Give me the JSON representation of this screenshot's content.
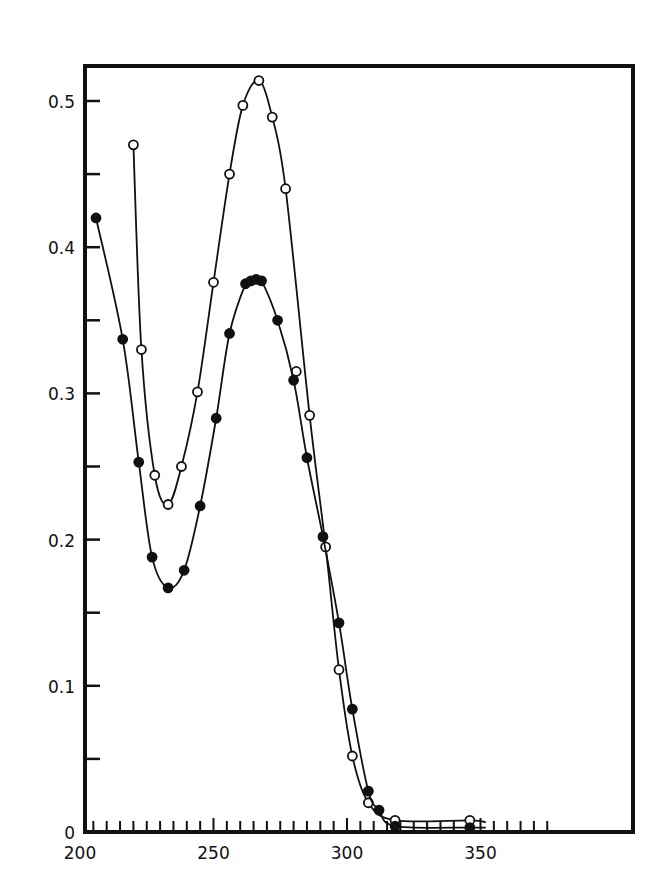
{
  "chart_data": {
    "type": "line",
    "title": "",
    "xlabel": "",
    "ylabel": "",
    "xlim": [
      200,
      378
    ],
    "ylim": [
      0,
      0.525
    ],
    "grid": false,
    "legend": null,
    "x_ticks": [
      "200",
      "250",
      "300",
      "350"
    ],
    "y_ticks": [
      "0",
      "0.1",
      "0.2",
      "0.3",
      "0.4",
      "0.5"
    ],
    "series": [
      {
        "name": "open circles",
        "marker": "open-circle",
        "x": [
          220,
          223,
          228,
          233,
          238,
          244,
          250,
          256,
          261,
          267,
          272,
          277,
          281,
          286,
          292,
          297,
          302,
          308,
          318,
          346
        ],
        "y": [
          0.47,
          0.33,
          0.244,
          0.224,
          0.25,
          0.301,
          0.376,
          0.45,
          0.497,
          0.514,
          0.489,
          0.44,
          0.315,
          0.285,
          0.195,
          0.111,
          0.052,
          0.02,
          0.008,
          0.008
        ]
      },
      {
        "name": "filled circles",
        "marker": "filled-circle",
        "x": [
          206,
          216,
          222,
          227,
          233,
          239,
          245,
          251,
          256,
          262,
          264,
          266,
          268,
          274,
          280,
          285,
          291,
          297,
          302,
          308,
          312,
          318,
          346
        ],
        "y": [
          0.42,
          0.337,
          0.253,
          0.188,
          0.167,
          0.179,
          0.223,
          0.283,
          0.341,
          0.375,
          0.377,
          0.378,
          0.377,
          0.35,
          0.309,
          0.256,
          0.202,
          0.143,
          0.084,
          0.028,
          0.015,
          0.004,
          0.003
        ]
      }
    ]
  }
}
